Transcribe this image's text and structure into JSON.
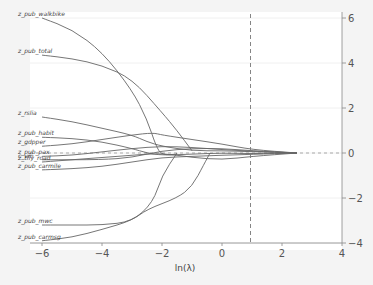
{
  "chart_data": {
    "type": "line",
    "title": "",
    "xlabel": "ln(λ)",
    "ylabel": "",
    "xlim": [
      -6,
      4
    ],
    "ylim": [
      -4,
      6
    ],
    "x_ticks": [
      "-6",
      "-4",
      "-2",
      "0",
      "2",
      "4"
    ],
    "y_ticks": [
      "6",
      "4",
      "2",
      "0",
      "-2",
      "-4"
    ],
    "y_axis_position": "right",
    "grid": true,
    "reference_line": {
      "x": 0.95,
      "style": "dashed"
    },
    "series": [
      {
        "name": "z_pub_walkbike",
        "x": [
          -6,
          -5,
          -4,
          -3,
          -2.5,
          -2.2,
          -2,
          -1.5
        ],
        "y": [
          6.0,
          5.5,
          4.5,
          2.8,
          1.5,
          0.3,
          -0.1,
          -0.05
        ]
      },
      {
        "name": "z_pub_total",
        "x": [
          -6,
          -5,
          -4,
          -3,
          -2,
          -1.5,
          -1
        ],
        "y": [
          4.35,
          4.2,
          3.9,
          3.3,
          1.8,
          1.0,
          0.1
        ]
      },
      {
        "name": "z_rslia",
        "x": [
          -6,
          -5,
          -4,
          -3,
          -2.5,
          -2,
          -1,
          0,
          1,
          2.5
        ],
        "y": [
          1.6,
          1.4,
          1.1,
          0.8,
          0.5,
          0.3,
          0.1,
          0.1,
          0.06,
          0
        ]
      },
      {
        "name": "z_pub_habit",
        "x": [
          -6,
          -5,
          -4,
          -3,
          -2.5,
          -2,
          -1,
          0,
          1,
          2.5
        ],
        "y": [
          0.7,
          0.65,
          0.5,
          0.2,
          0.0,
          -0.1,
          -0.05,
          0,
          -0.03,
          0
        ]
      },
      {
        "name": "z_gdpper",
        "x": [
          -6,
          -5,
          -4,
          -3,
          -2.3,
          -2,
          -1,
          0,
          1,
          2.5
        ],
        "y": [
          0.3,
          0.4,
          0.6,
          0.8,
          0.9,
          0.8,
          0.6,
          0.4,
          0.15,
          0
        ]
      },
      {
        "name": "z_pub_pax",
        "x": [
          -6,
          -5,
          -4,
          -3,
          -2,
          -1,
          0,
          1,
          2.5
        ],
        "y": [
          -0.15,
          -0.1,
          0.05,
          0.2,
          0.3,
          0.25,
          0.15,
          0.08,
          0
        ]
      },
      {
        "name": "c_vm",
        "x": [
          -6,
          -4,
          -3,
          -2,
          -1,
          0,
          1,
          2.5
        ],
        "y": [
          -0.3,
          -0.3,
          -0.2,
          0.1,
          0.2,
          0.2,
          0.1,
          0
        ]
      },
      {
        "name": "z_tfly_road",
        "x": [
          -6,
          -5,
          -4,
          -3,
          -2,
          -1,
          0,
          1,
          2.5
        ],
        "y": [
          -0.4,
          -0.3,
          -0.2,
          -0.1,
          0.0,
          -0.2,
          -0.3,
          -0.15,
          0
        ]
      },
      {
        "name": "z_pub_carmile",
        "x": [
          -6,
          -5,
          -4,
          -3,
          -2,
          -1,
          0,
          1,
          2.5
        ],
        "y": [
          -0.75,
          -0.7,
          -0.6,
          -0.4,
          -0.2,
          -0.15,
          -0.1,
          -0.06,
          0
        ]
      },
      {
        "name": "z_pub_mwc",
        "x": [
          -6,
          -5,
          -4,
          -3,
          -2.3,
          -2,
          -1.5
        ],
        "y": [
          -3.2,
          -3.2,
          -3.2,
          -3.05,
          -2.2,
          -1.0,
          0.0
        ]
      },
      {
        "name": "z_pub_carmsg",
        "x": [
          -6,
          -5,
          -4,
          -3,
          -2.5,
          -1.5,
          -1,
          -0.6,
          -0.4
        ],
        "y": [
          -3.9,
          -3.75,
          -3.4,
          -3.0,
          -2.5,
          -2.0,
          -1.5,
          -0.5,
          0.0
        ]
      }
    ]
  }
}
